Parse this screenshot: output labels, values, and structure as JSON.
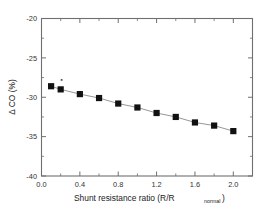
{
  "chart_data": {
    "type": "scatter",
    "title": "",
    "subtitle": "",
    "xlabel": "Shunt resistance ratio (R/R",
    "xlabel_subscript": "normal",
    "xlabel_tail": ")",
    "ylabel": "Δ CO (%)",
    "xlim": [
      0.0,
      2.2
    ],
    "ylim": [
      -40,
      -20
    ],
    "grid": false,
    "legend": null,
    "marker_style": "filled-square",
    "line_style": "solid-connector",
    "x": [
      0.1,
      0.2,
      0.4,
      0.6,
      0.8,
      1.0,
      1.2,
      1.4,
      1.6,
      1.8,
      2.0
    ],
    "values": [
      -28.6,
      -29.0,
      -29.6,
      -30.1,
      -30.8,
      -31.3,
      -32.0,
      -32.5,
      -33.2,
      -33.6,
      -34.3
    ],
    "series": [
      {
        "name": "Δ CO vs shunt resistance ratio",
        "x": [
          0.1,
          0.2,
          0.4,
          0.6,
          0.8,
          1.0,
          1.2,
          1.4,
          1.6,
          1.8,
          2.0
        ],
        "values": [
          -28.6,
          -29.0,
          -29.6,
          -30.1,
          -30.8,
          -31.3,
          -32.0,
          -32.5,
          -33.2,
          -33.6,
          -34.3
        ]
      }
    ],
    "stray_marks": [
      {
        "x": 0.21,
        "y": -27.8,
        "note": "small speck artifact"
      }
    ],
    "xticks": [
      0.0,
      0.4,
      0.8,
      1.2,
      1.6,
      2.0
    ],
    "xtick_labels": [
      "0.0",
      "0.4",
      "0.8",
      "1.2",
      "1.6",
      "2.0"
    ],
    "xticks_minor": [
      0.2,
      0.6,
      1.0,
      1.4,
      1.8,
      2.2
    ],
    "yticks": [
      -20,
      -25,
      -30,
      -35,
      -40
    ],
    "ytick_labels": [
      "-20",
      "-25",
      "-30",
      "-35",
      "-40"
    ],
    "yticks_minor": [
      -22.5,
      -27.5,
      -32.5,
      -37.5
    ],
    "colors": {
      "marker": "#111111",
      "line": "#8a8a8a",
      "axis": "#6f6f6f",
      "text": "#222222",
      "background": "#ffffff"
    }
  }
}
